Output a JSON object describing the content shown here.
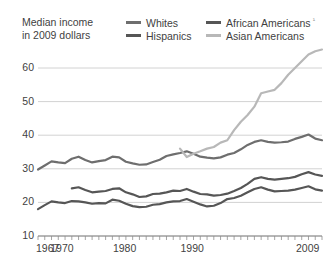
{
  "caption": "Median income\nin 2009 dollars",
  "footnote_mark": "¹",
  "legend": {
    "items": [
      {
        "label": "Whites",
        "color": "#6e6e6e",
        "row": 0,
        "col": 0
      },
      {
        "label": "African Americans",
        "color": "#565656",
        "row": 0,
        "col": 1
      },
      {
        "label": "Hispanics",
        "color": "#565656",
        "row": 1,
        "col": 0
      },
      {
        "label": "Asian Americans",
        "color": "#b8b8b8",
        "row": 1,
        "col": 1
      }
    ]
  },
  "axis": {
    "y_ticks": [
      "10",
      "20",
      "30",
      "40",
      "50",
      "60"
    ],
    "x_ticks": [
      "1967",
      "1970",
      "1980",
      "1990",
      "2009"
    ]
  },
  "chart_data": {
    "type": "line",
    "title": "Median income in 2009 dollars",
    "xlabel": "",
    "ylabel": "Median income in 2009 dollars (thousands)",
    "xlim": [
      1967,
      2009
    ],
    "ylim": [
      10,
      66
    ],
    "grid": true,
    "legend_position": "top",
    "y_tick_values": [
      10,
      20,
      30,
      40,
      50,
      60
    ],
    "x_tick_values": [
      1967,
      1970,
      1980,
      1990,
      2009
    ],
    "x_minor_tick_interval": 1,
    "units": "thousands of 2009 dollars",
    "annotations": [
      "Asian Americans series begins in 1988",
      "Hispanics series begins in 1972",
      "Footnote marker after African Americans legend entry"
    ],
    "series": [
      {
        "name": "Whites",
        "color": "#6e6e6e",
        "x": [
          1967,
          1968,
          1969,
          1970,
          1971,
          1972,
          1973,
          1974,
          1975,
          1976,
          1977,
          1978,
          1979,
          1980,
          1981,
          1982,
          1983,
          1984,
          1985,
          1986,
          1987,
          1988,
          1989,
          1990,
          1991,
          1992,
          1993,
          1994,
          1995,
          1996,
          1997,
          1998,
          1999,
          2000,
          2001,
          2002,
          2003,
          2004,
          2005,
          2006,
          2007,
          2008,
          2009
        ],
        "values": [
          29.8,
          31.0,
          32.2,
          31.9,
          31.7,
          33.0,
          33.6,
          32.6,
          31.9,
          32.3,
          32.6,
          33.6,
          33.4,
          32.1,
          31.6,
          31.2,
          31.3,
          32.0,
          32.7,
          33.8,
          34.3,
          34.7,
          35.2,
          34.5,
          33.6,
          33.3,
          33.1,
          33.4,
          34.2,
          34.7,
          35.8,
          37.1,
          38.0,
          38.5,
          38.0,
          37.8,
          37.9,
          38.1,
          38.9,
          39.5,
          40.2,
          39.0,
          38.5
        ]
      },
      {
        "name": "African Americans",
        "color": "#565656",
        "x": [
          1967,
          1968,
          1969,
          1970,
          1971,
          1972,
          1973,
          1974,
          1975,
          1976,
          1977,
          1978,
          1979,
          1980,
          1981,
          1982,
          1983,
          1984,
          1985,
          1986,
          1987,
          1988,
          1989,
          1990,
          1991,
          1992,
          1993,
          1994,
          1995,
          1996,
          1997,
          1998,
          1999,
          2000,
          2001,
          2002,
          2003,
          2004,
          2005,
          2006,
          2007,
          2008,
          2009
        ],
        "values": [
          18.0,
          19.2,
          20.3,
          20.0,
          19.8,
          20.4,
          20.3,
          20.0,
          19.6,
          19.8,
          19.7,
          20.8,
          20.5,
          19.6,
          18.9,
          18.6,
          18.7,
          19.3,
          19.5,
          20.0,
          20.3,
          20.4,
          21.0,
          20.2,
          19.4,
          18.8,
          19.0,
          19.8,
          21.0,
          21.3,
          22.0,
          23.0,
          24.0,
          24.5,
          23.8,
          23.3,
          23.4,
          23.5,
          23.8,
          24.3,
          24.8,
          23.9,
          23.5
        ]
      },
      {
        "name": "Hispanics",
        "color": "#565656",
        "x": [
          1972,
          1973,
          1974,
          1975,
          1976,
          1977,
          1978,
          1979,
          1980,
          1981,
          1982,
          1983,
          1984,
          1985,
          1986,
          1987,
          1988,
          1989,
          1990,
          1991,
          1992,
          1993,
          1994,
          1995,
          1996,
          1997,
          1998,
          1999,
          2000,
          2001,
          2002,
          2003,
          2004,
          2005,
          2006,
          2007,
          2008,
          2009
        ],
        "values": [
          24.2,
          24.5,
          23.7,
          23.0,
          23.2,
          23.4,
          24.0,
          24.2,
          23.0,
          22.4,
          21.6,
          21.8,
          22.5,
          22.6,
          23.0,
          23.5,
          23.4,
          24.0,
          23.2,
          22.5,
          22.4,
          22.0,
          22.2,
          22.6,
          23.4,
          24.3,
          25.5,
          27.0,
          27.5,
          27.0,
          26.8,
          27.0,
          27.2,
          27.6,
          28.4,
          29.0,
          28.3,
          27.9
        ]
      },
      {
        "name": "Asian Americans",
        "color": "#b8b8b8",
        "x": [
          1988,
          1989,
          1990,
          1991,
          1992,
          1993,
          1994,
          1995,
          1996,
          1997,
          1998,
          1999,
          2000,
          2001,
          2002,
          2003,
          2004,
          2005,
          2006,
          2007,
          2008,
          2009
        ],
        "values": [
          36.0,
          33.5,
          34.5,
          35.2,
          36.0,
          36.5,
          37.8,
          38.5,
          41.5,
          44.0,
          46.0,
          48.5,
          52.5,
          53.0,
          53.5,
          55.5,
          58.0,
          60.0,
          62.0,
          64.0,
          65.0,
          65.5
        ]
      }
    ]
  }
}
